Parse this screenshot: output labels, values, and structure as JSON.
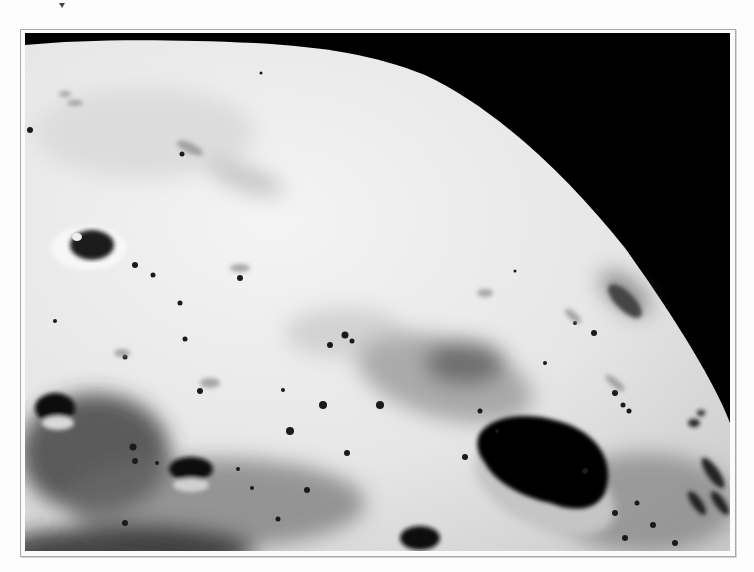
{
  "figure": {
    "palette": {
      "sky": "#000000",
      "surface_light": "#eeeeee",
      "surface_mid": "#bdbdbd",
      "surface_dark": "#2a2a2a",
      "frame_border": "#a9a9a9",
      "page_background": "#fdfdfd"
    },
    "marker_icon": "triangle-down-icon"
  }
}
